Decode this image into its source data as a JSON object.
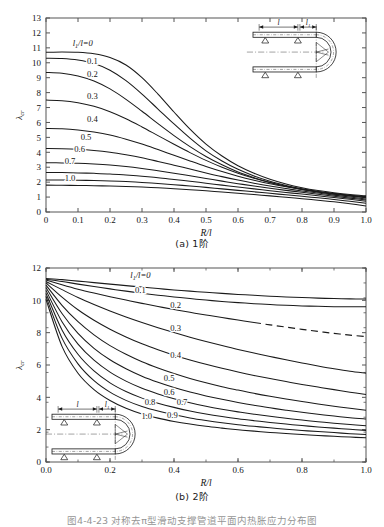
{
  "figure": {
    "caption": "图4-4-23  对称去π型滑动支撑管道平面内热胀应力分布图",
    "panel_a_caption": "(a) 1阶",
    "panel_b_caption": "(b) 2阶"
  },
  "inset": {
    "label_l": "l",
    "label_l1": "l₁",
    "name": "u-bend-pipe-with-sliding-supports"
  },
  "chart_data": [
    {
      "type": "line",
      "title": "(a) 1阶",
      "xlabel": "R/l",
      "ylabel": "λcr",
      "xlim": [
        0,
        1.0
      ],
      "ylim": [
        0,
        13
      ],
      "xticks": [
        "0",
        "0.1",
        "0.2",
        "0.3",
        "0.4",
        "0.5",
        "0.6",
        "0.7",
        "0.8",
        "0.9",
        "1.0"
      ],
      "yticks": [
        "0",
        "1",
        "2",
        "3",
        "4",
        "5",
        "6",
        "7",
        "8",
        "9",
        "10",
        "11",
        "12",
        "13"
      ],
      "grid": false,
      "legend": "inline-curve-labels",
      "x": [
        0,
        0.05,
        0.1,
        0.15,
        0.2,
        0.25,
        0.3,
        0.35,
        0.4,
        0.45,
        0.5,
        0.55,
        0.6,
        0.65,
        0.7,
        0.75,
        0.8,
        0.85,
        0.9,
        0.95,
        1.0
      ],
      "series": [
        {
          "name": "l₁/l=0",
          "label": "l₁/l=0",
          "values": [
            10.7,
            10.72,
            10.7,
            10.6,
            10.35,
            9.85,
            9.0,
            7.9,
            6.7,
            5.55,
            4.55,
            3.75,
            3.1,
            2.6,
            2.2,
            1.88,
            1.63,
            1.44,
            1.29,
            1.17,
            1.08
          ]
        },
        {
          "name": "0.1",
          "label": "0.1",
          "values": [
            10.3,
            10.28,
            10.18,
            9.95,
            9.5,
            8.8,
            7.9,
            6.9,
            5.9,
            4.95,
            4.1,
            3.42,
            2.86,
            2.42,
            2.06,
            1.78,
            1.55,
            1.37,
            1.23,
            1.12,
            1.03
          ]
        },
        {
          "name": "0.2",
          "label": "0.2",
          "values": [
            9.35,
            9.3,
            9.12,
            8.78,
            8.25,
            7.55,
            6.75,
            5.92,
            5.12,
            4.38,
            3.72,
            3.16,
            2.68,
            2.3,
            1.98,
            1.72,
            1.51,
            1.34,
            1.2,
            1.09,
            1.0
          ]
        },
        {
          "name": "0.3",
          "label": "0.3",
          "values": [
            7.5,
            7.46,
            7.32,
            7.08,
            6.72,
            6.25,
            5.7,
            5.12,
            4.54,
            3.98,
            3.46,
            3.0,
            2.6,
            2.26,
            1.97,
            1.73,
            1.53,
            1.36,
            1.22,
            1.1,
            0.99
          ]
        },
        {
          "name": "0.4",
          "label": "0.4",
          "values": [
            5.6,
            5.58,
            5.5,
            5.36,
            5.16,
            4.88,
            4.55,
            4.18,
            3.8,
            3.42,
            3.05,
            2.71,
            2.4,
            2.13,
            1.89,
            1.69,
            1.51,
            1.35,
            1.2,
            1.07,
            0.95
          ]
        },
        {
          "name": "0.5",
          "label": "0.5",
          "values": [
            4.25,
            4.24,
            4.2,
            4.12,
            4.0,
            3.83,
            3.63,
            3.39,
            3.14,
            2.88,
            2.62,
            2.37,
            2.14,
            1.93,
            1.74,
            1.57,
            1.41,
            1.27,
            1.13,
            1.0,
            0.87
          ]
        },
        {
          "name": "0.6",
          "label": "0.6",
          "values": [
            3.3,
            3.29,
            3.27,
            3.22,
            3.15,
            3.05,
            2.92,
            2.77,
            2.6,
            2.43,
            2.25,
            2.07,
            1.9,
            1.74,
            1.59,
            1.45,
            1.32,
            1.19,
            1.06,
            0.93,
            0.8
          ]
        },
        {
          "name": "0.7",
          "label": "0.7",
          "values": [
            2.65,
            2.64,
            2.62,
            2.59,
            2.55,
            2.48,
            2.4,
            2.3,
            2.18,
            2.06,
            1.93,
            1.8,
            1.67,
            1.55,
            1.43,
            1.31,
            1.2,
            1.09,
            0.97,
            0.85,
            0.72
          ]
        },
        {
          "name": "0.85",
          "label": "",
          "values": [
            2.15,
            2.14,
            2.13,
            2.11,
            2.08,
            2.04,
            1.98,
            1.91,
            1.83,
            1.74,
            1.65,
            1.55,
            1.45,
            1.35,
            1.25,
            1.15,
            1.05,
            0.95,
            0.84,
            0.72,
            0.59
          ]
        },
        {
          "name": "1.0",
          "label": "1.0",
          "values": [
            1.8,
            1.79,
            1.78,
            1.76,
            1.74,
            1.71,
            1.67,
            1.62,
            1.56,
            1.49,
            1.42,
            1.34,
            1.26,
            1.17,
            1.08,
            0.99,
            0.89,
            0.79,
            0.68,
            0.55,
            0.4
          ]
        }
      ]
    },
    {
      "type": "line",
      "title": "(b) 2阶",
      "xlabel": "R/l",
      "ylabel": "λcr",
      "xlim": [
        0,
        1.0
      ],
      "ylim": [
        0,
        13
      ],
      "xticks": [
        "0.0",
        "0.2",
        "0.4",
        "0.6",
        "0.8",
        "1.0"
      ],
      "yticks": [
        "0",
        "2",
        "4",
        "6",
        "8",
        "10",
        "12"
      ],
      "grid": false,
      "legend": "inline-curve-labels",
      "x": [
        0,
        0.05,
        0.1,
        0.15,
        0.2,
        0.25,
        0.3,
        0.35,
        0.4,
        0.45,
        0.5,
        0.55,
        0.6,
        0.65,
        0.7,
        0.75,
        0.8,
        0.85,
        0.9,
        0.95,
        1.0
      ],
      "series": [
        {
          "name": "l₁/l=0",
          "label": "l₁/l=0",
          "dashed": false,
          "values": [
            12.3,
            12.22,
            12.12,
            12.02,
            11.92,
            11.82,
            11.72,
            11.62,
            11.53,
            11.45,
            11.37,
            11.3,
            11.23,
            11.17,
            11.11,
            11.06,
            11.02,
            10.98,
            10.95,
            10.93,
            10.92
          ]
        },
        {
          "name": "0.1",
          "label": "0.1",
          "dashed": false,
          "values": [
            12.25,
            12.1,
            11.92,
            11.76,
            11.6,
            11.45,
            11.31,
            11.18,
            11.06,
            10.95,
            10.85,
            10.76,
            10.68,
            10.61,
            10.55,
            10.5,
            10.46,
            10.43,
            10.41,
            10.4,
            10.4
          ]
        },
        {
          "name": "0.2",
          "label": "0.2",
          "dashed": true,
          "dash_from": 0.65,
          "values": [
            12.2,
            11.88,
            11.58,
            11.32,
            11.08,
            10.85,
            10.63,
            10.42,
            10.22,
            10.03,
            9.85,
            9.68,
            9.51,
            9.35,
            9.19,
            9.04,
            8.89,
            8.75,
            8.62,
            8.5,
            8.4
          ]
        },
        {
          "name": "0.3",
          "label": "0.3",
          "dashed": false,
          "values": [
            12.1,
            11.55,
            11.02,
            10.55,
            10.12,
            9.72,
            9.35,
            9.0,
            8.67,
            8.36,
            8.07,
            7.8,
            7.54,
            7.3,
            7.07,
            6.85,
            6.64,
            6.44,
            6.25,
            6.08,
            5.95
          ]
        },
        {
          "name": "0.4",
          "label": "0.4",
          "dashed": false,
          "values": [
            12.0,
            11.05,
            10.2,
            9.5,
            8.9,
            8.38,
            7.92,
            7.52,
            7.16,
            6.84,
            6.55,
            6.28,
            6.03,
            5.8,
            5.59,
            5.39,
            5.2,
            5.02,
            4.85,
            4.68,
            4.52
          ]
        },
        {
          "name": "0.5",
          "label": "0.5",
          "dashed": false,
          "values": [
            11.85,
            10.5,
            9.4,
            8.52,
            7.8,
            7.22,
            6.72,
            6.3,
            5.93,
            5.6,
            5.31,
            5.05,
            4.82,
            4.6,
            4.4,
            4.22,
            4.05,
            3.89,
            3.74,
            3.6,
            3.47
          ]
        },
        {
          "name": "0.6",
          "label": "0.6",
          "dashed": false,
          "values": [
            11.7,
            9.95,
            8.62,
            7.62,
            6.85,
            6.25,
            5.75,
            5.34,
            4.99,
            4.69,
            4.43,
            4.2,
            3.99,
            3.8,
            3.63,
            3.47,
            3.33,
            3.2,
            3.08,
            2.97,
            2.88
          ]
        },
        {
          "name": "0.7",
          "label": "0.7",
          "dashed": false,
          "values": [
            11.5,
            9.4,
            7.9,
            6.82,
            6.02,
            5.42,
            4.94,
            4.56,
            4.24,
            3.97,
            3.74,
            3.54,
            3.36,
            3.2,
            3.06,
            2.93,
            2.81,
            2.7,
            2.6,
            2.51,
            2.43
          ]
        },
        {
          "name": "0.8",
          "label": "0.8",
          "dashed": false,
          "values": [
            11.3,
            8.85,
            7.22,
            6.1,
            5.3,
            4.72,
            4.28,
            3.94,
            3.66,
            3.42,
            3.22,
            3.05,
            2.9,
            2.77,
            2.65,
            2.54,
            2.44,
            2.35,
            2.27,
            2.19,
            2.12
          ]
        },
        {
          "name": "0.9",
          "label": "0.9",
          "dashed": false,
          "values": [
            11.1,
            8.3,
            6.58,
            5.45,
            4.68,
            4.13,
            3.72,
            3.41,
            3.16,
            2.95,
            2.78,
            2.63,
            2.5,
            2.39,
            2.29,
            2.2,
            2.11,
            2.04,
            1.97,
            1.9,
            1.84
          ]
        },
        {
          "name": "1.0",
          "label": "1.0",
          "dashed": false,
          "values": [
            10.9,
            7.75,
            5.95,
            4.85,
            4.12,
            3.6,
            3.22,
            2.94,
            2.72,
            2.54,
            2.39,
            2.27,
            2.16,
            2.07,
            1.98,
            1.91,
            1.84,
            1.78,
            1.72,
            1.67,
            1.62
          ]
        }
      ]
    }
  ],
  "curve_label_positions_a": [
    {
      "label": "l₁/l=0",
      "x": 0.115,
      "y": 11.15
    },
    {
      "label": "0.1",
      "x": 0.145,
      "y": 9.95
    },
    {
      "label": "0.2",
      "x": 0.145,
      "y": 9.05
    },
    {
      "label": "0.3",
      "x": 0.145,
      "y": 7.6
    },
    {
      "label": "0.4",
      "x": 0.145,
      "y": 6.0
    },
    {
      "label": "0.5",
      "x": 0.125,
      "y": 4.85
    },
    {
      "label": "0.6",
      "x": 0.105,
      "y": 4.0
    },
    {
      "label": "0.7",
      "x": 0.075,
      "y": 3.25
    },
    {
      "label": "1.0",
      "x": 0.075,
      "y": 2.05
    }
  ],
  "curve_label_positions_b": [
    {
      "label": "l₁/l=0",
      "x": 0.295,
      "y": 12.35
    },
    {
      "label": "0.1",
      "x": 0.295,
      "y": 11.35
    },
    {
      "label": "0.2",
      "x": 0.405,
      "y": 10.35
    },
    {
      "label": "0.3",
      "x": 0.405,
      "y": 8.75
    },
    {
      "label": "0.4",
      "x": 0.405,
      "y": 7.0
    },
    {
      "label": "0.5",
      "x": 0.385,
      "y": 5.45
    },
    {
      "label": "0.6",
      "x": 0.385,
      "y": 4.5
    },
    {
      "label": "0.7",
      "x": 0.425,
      "y": 3.85
    },
    {
      "label": "0.8",
      "x": 0.325,
      "y": 3.85
    },
    {
      "label": "0.9",
      "x": 0.395,
      "y": 2.95
    },
    {
      "label": "1.0",
      "x": 0.315,
      "y": 2.85
    }
  ],
  "style": {
    "line_color": "#1a1a1a",
    "axis_color": "#555555",
    "background": "#ffffff"
  }
}
